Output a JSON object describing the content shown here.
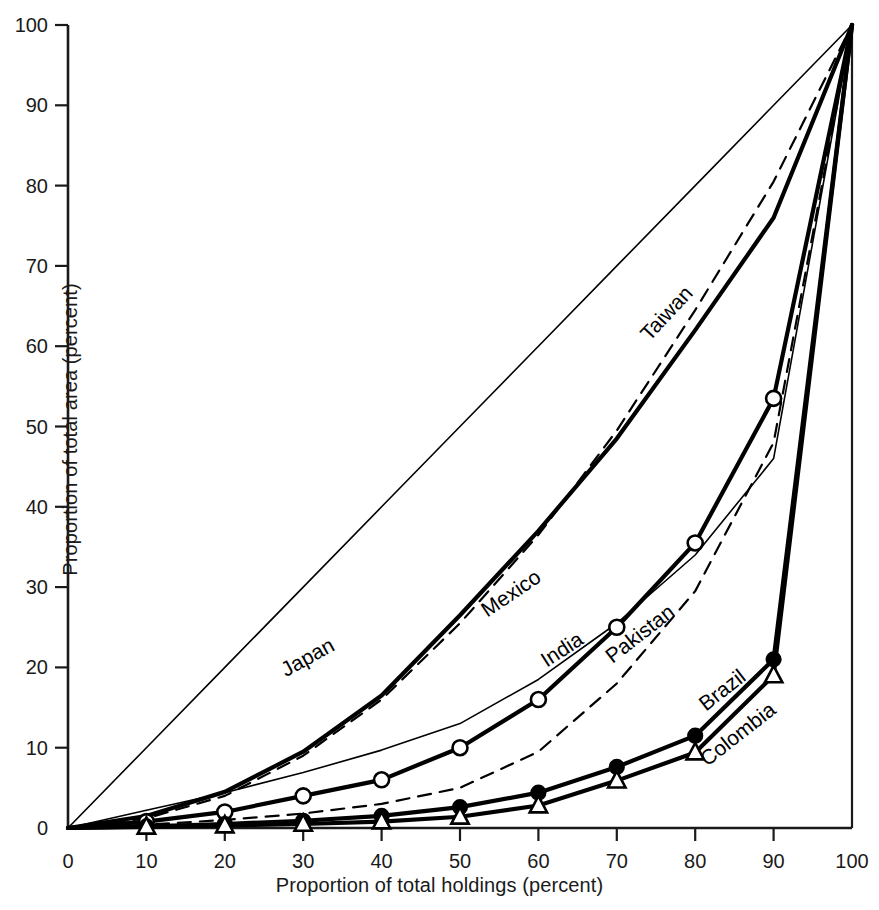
{
  "chart_data": {
    "type": "line",
    "title": "",
    "subtitle": "",
    "xlabel": "Proportion of total holdings (percent)",
    "ylabel": "Proportion of total area (percent)",
    "xlim": [
      0,
      100
    ],
    "ylim": [
      0,
      100
    ],
    "grid": false,
    "legend_position": "inline-curve-labels",
    "xticks": [
      0,
      10,
      20,
      30,
      40,
      50,
      60,
      70,
      80,
      90,
      100
    ],
    "yticks": [
      0,
      10,
      20,
      30,
      40,
      50,
      60,
      70,
      80,
      90,
      100
    ],
    "xtick_labels": [
      "0",
      "10",
      "20",
      "30",
      "40",
      "50",
      "60",
      "70",
      "80",
      "90",
      "100"
    ],
    "ytick_labels": [
      "0",
      "10",
      "20",
      "30",
      "40",
      "50",
      "60",
      "70",
      "80",
      "90",
      "100"
    ],
    "annotations": [
      {
        "text": "line of perfect equality (45 degree diagonal)",
        "kind": "reference-line"
      }
    ],
    "x": [
      0,
      10,
      20,
      30,
      40,
      50,
      60,
      70,
      80,
      90,
      100
    ],
    "series": [
      {
        "name": "Equality",
        "label": "",
        "style": "solid",
        "width": "thin",
        "marker": "none",
        "color": "#000000",
        "values": [
          0,
          10,
          20,
          30,
          40,
          50,
          60,
          70,
          80,
          90,
          100
        ]
      },
      {
        "name": "Japan",
        "label": "Japan",
        "style": "solid",
        "width": "thick",
        "marker": "none",
        "color": "#000000",
        "label_x": 31,
        "label_y": 20.5,
        "label_angle": -29,
        "values": [
          0,
          1.5,
          4.5,
          9.5,
          16.5,
          26.5,
          37,
          48.5,
          62,
          76,
          100
        ]
      },
      {
        "name": "Taiwan",
        "label": "Taiwan",
        "style": "dashed",
        "width": "medium",
        "marker": "none",
        "color": "#000000",
        "label_x": 77,
        "label_y": 63.5,
        "label_angle": -47,
        "values": [
          0,
          1.2,
          4.0,
          9.0,
          16.0,
          25.5,
          36.5,
          49.5,
          64.5,
          80.5,
          100
        ]
      },
      {
        "name": "Mexico",
        "label": "Mexico",
        "style": "solid",
        "width": "thin",
        "marker": "none",
        "color": "#000000",
        "label_x": 57,
        "label_y": 28.5,
        "label_angle": -34,
        "values": [
          0,
          2.2,
          4.4,
          6.9,
          9.7,
          13.0,
          18.5,
          25.5,
          34.0,
          46.0,
          100
        ]
      },
      {
        "name": "India",
        "label": "India",
        "style": "solid",
        "width": "thick",
        "marker": "open-circle",
        "color": "#000000",
        "label_x": 63.5,
        "label_y": 21.5,
        "label_angle": -33,
        "values": [
          0,
          0.8,
          2.0,
          4.0,
          6.0,
          10.0,
          16.0,
          25.0,
          35.5,
          53.5,
          100
        ]
      },
      {
        "name": "Pakistan",
        "label": "Pakistan",
        "style": "dashed",
        "width": "medium",
        "marker": "none",
        "color": "#000000",
        "label_x": 73.5,
        "label_y": 23.5,
        "label_angle": -38,
        "values": [
          0,
          0.4,
          1.0,
          1.8,
          3.0,
          5.0,
          9.5,
          18.0,
          29.5,
          48.0,
          100
        ]
      },
      {
        "name": "Brazil",
        "label": "Brazil",
        "style": "solid",
        "width": "thick",
        "marker": "filled-circle",
        "color": "#000000",
        "label_x": 84,
        "label_y": 16.5,
        "label_angle": -38,
        "values": [
          0,
          0.2,
          0.5,
          0.9,
          1.5,
          2.6,
          4.4,
          7.6,
          11.5,
          21.0,
          100
        ]
      },
      {
        "name": "Colombia",
        "label": "Colombia",
        "style": "solid",
        "width": "thick",
        "marker": "open-triangle",
        "color": "#000000",
        "label_x": 86,
        "label_y": 11.0,
        "label_angle": -38,
        "values": [
          0,
          0.15,
          0.3,
          0.5,
          0.8,
          1.4,
          2.8,
          5.9,
          9.4,
          19.0,
          100
        ]
      }
    ]
  },
  "axes": {
    "x_title": "Proportion of total holdings (percent)",
    "y_title": "Proportion of total area (percent)"
  },
  "colors": {
    "ink": "#1a1a1a",
    "line": "#000000",
    "background": "#ffffff"
  }
}
